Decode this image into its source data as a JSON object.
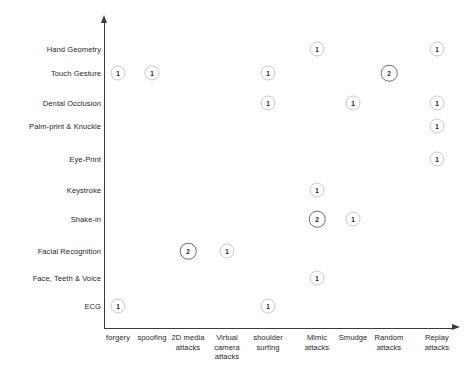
{
  "chart_data": {
    "type": "scatter",
    "title": "",
    "subtitle": "",
    "xlabel": "",
    "ylabel": "",
    "grid": false,
    "legend": "none",
    "categories_x": [
      "forgery",
      "spoofing",
      "2D media attacks",
      "Virtual camera attacks",
      "shoulder surfing",
      "Mimic attacks",
      "Smudge",
      "Random attacks",
      "Replay attacks"
    ],
    "categories_y": [
      "Hand Geometry",
      "Touch Gesture",
      "Dental Occlusion",
      "Palm-print & Knuckle",
      "Eye-Print",
      "Keystroke",
      "Shake-in",
      "Facial Recognition",
      "Face, Teeth & Voice",
      "ECG"
    ],
    "points": [
      {
        "x": "Mimic attacks",
        "y": "Hand Geometry",
        "value": "1"
      },
      {
        "x": "Replay attacks",
        "y": "Hand Geometry",
        "value": "1"
      },
      {
        "x": "forgery",
        "y": "Touch Gesture",
        "value": "1"
      },
      {
        "x": "spoofing",
        "y": "Touch Gesture",
        "value": "1"
      },
      {
        "x": "shoulder surfing",
        "y": "Touch Gesture",
        "value": "1"
      },
      {
        "x": "Random attacks",
        "y": "Touch Gesture",
        "value": "2"
      },
      {
        "x": "shoulder surfing",
        "y": "Dental Occlusion",
        "value": "1"
      },
      {
        "x": "Smudge",
        "y": "Dental Occlusion",
        "value": "1"
      },
      {
        "x": "Replay attacks",
        "y": "Dental Occlusion",
        "value": "1"
      },
      {
        "x": "Replay attacks",
        "y": "Palm-print & Knuckle",
        "value": "1"
      },
      {
        "x": "Replay attacks",
        "y": "Eye-Print",
        "value": "1"
      },
      {
        "x": "Mimic attacks",
        "y": "Keystroke",
        "value": "1"
      },
      {
        "x": "Mimic attacks",
        "y": "Shake-in",
        "value": "2"
      },
      {
        "x": "Smudge",
        "y": "Shake-in",
        "value": "1"
      },
      {
        "x": "2D media attacks",
        "y": "Facial Recognition",
        "value": "2"
      },
      {
        "x": "Virtual camera attacks",
        "y": "Facial Recognition",
        "value": "1"
      },
      {
        "x": "Mimic attacks",
        "y": "Face, Teeth & Voice",
        "value": "1"
      },
      {
        "x": "forgery",
        "y": "ECG",
        "value": "1"
      },
      {
        "x": "shoulder surfing",
        "y": "ECG",
        "value": "1"
      }
    ]
  },
  "axes": {
    "x_positions": {
      "forgery": 118,
      "spoofing": 152,
      "2D media attacks": 188,
      "Virtual camera attacks": 227,
      "shoulder surfing": 268,
      "Mimic attacks": 317,
      "Smudge": 353,
      "Random attacks": 389,
      "Replay attacks": 437
    },
    "y_positions": {
      "Hand Geometry": 49,
      "Touch Gesture": 73,
      "Dental Occlusion": 103,
      "Palm-print & Knuckle": 126,
      "Eye-Print": 159,
      "Keystroke": 190,
      "Shake-in": 219,
      "Facial Recognition": 251,
      "Face, Teeth & Voice": 278,
      "ECG": 306
    },
    "x_label_positions": {
      "forgery": 118,
      "spoofing": 152,
      "2D media attacks": 188,
      "Virtual camera attacks": 227,
      "shoulder surfing": 268,
      "Mimic attacks": 317,
      "Smudge": 353,
      "Random attacks": 389,
      "Replay attacks": 437
    }
  },
  "colors": {
    "axis": "#3a3a3a",
    "text": "#272727",
    "bubble_light_border": "#c9c9c9",
    "bubble_dark_border": "#6d6d6d",
    "background": "#ffffff"
  }
}
